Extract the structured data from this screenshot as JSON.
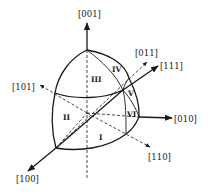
{
  "figure": {
    "type": "stereographic-octant-diagram",
    "axes": [
      {
        "id": "001",
        "label": "[001]",
        "style": "solid"
      },
      {
        "id": "011",
        "label": "[011]",
        "style": "dashed"
      },
      {
        "id": "111",
        "label": "[111]",
        "style": "solid"
      },
      {
        "id": "101",
        "label": "[101]",
        "style": "dashed"
      },
      {
        "id": "010",
        "label": "[010]",
        "style": "solid"
      },
      {
        "id": "110",
        "label": "[110]",
        "style": "dashed"
      },
      {
        "id": "100",
        "label": "[100]",
        "style": "solid"
      }
    ],
    "regions": [
      {
        "id": "I",
        "label": "I"
      },
      {
        "id": "II",
        "label": "II"
      },
      {
        "id": "III",
        "label": "III"
      },
      {
        "id": "IV",
        "label": "IV"
      },
      {
        "id": "V",
        "label": "V"
      },
      {
        "id": "VI",
        "label": "VI"
      }
    ],
    "colors": {
      "ink": "#1a1a1a",
      "background": "#ffffff"
    }
  }
}
